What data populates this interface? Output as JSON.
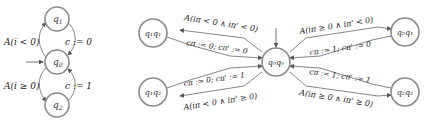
{
  "left_automaton": {
    "states": [
      {
        "id": "q1",
        "label": "q",
        "sub": "1"
      },
      {
        "id": "q0",
        "label": "q",
        "sub": "0"
      },
      {
        "id": "q2",
        "label": "q",
        "sub": "2"
      }
    ],
    "initial": "q0",
    "edges": [
      {
        "from": "q0",
        "to": "q1",
        "label": "A(i < 0)"
      },
      {
        "from": "q1",
        "to": "q0",
        "label": "c := 0"
      },
      {
        "from": "q0",
        "to": "q2",
        "label": "A(i ≥ 0)"
      },
      {
        "from": "q2",
        "to": "q0",
        "label": "c := 1"
      }
    ]
  },
  "product_automaton": {
    "states": [
      {
        "id": "q0q0",
        "label": "q₀q₀"
      },
      {
        "id": "q1q1",
        "label": "q₁q₁"
      },
      {
        "id": "q1q2",
        "label": "q₁q₂"
      },
      {
        "id": "q2q1",
        "label": "q₂q₁"
      },
      {
        "id": "q2q2",
        "label": "q₂q₂"
      }
    ],
    "initial": "q0q0",
    "edges": [
      {
        "from": "q0q0",
        "to": "q1q1",
        "label": "A(iπ < 0 ∧ iπ' < 0)"
      },
      {
        "from": "q1q1",
        "to": "q0q0",
        "label": "cπ := 0; cπ' := 0"
      },
      {
        "from": "q1q2",
        "to": "q0q0",
        "label": "cπ := 0; cπ' := 1"
      },
      {
        "from": "q0q0",
        "to": "q1q2",
        "label": "A(iπ < 0 ∧ iπ' ≥ 0)"
      },
      {
        "from": "q0q0",
        "to": "q2q1",
        "label": "A(iπ ≥ 0 ∧ iπ' < 0)"
      },
      {
        "from": "q2q1",
        "to": "q0q0",
        "label": "cπ := 1; cπ' := 0"
      },
      {
        "from": "q2q2",
        "to": "q0q0",
        "label": "cπ := 1; cπ' := 1"
      },
      {
        "from": "q0q0",
        "to": "q2q2",
        "label": "A(iπ ≥ 0 ∧ iπ' ≥ 0)"
      }
    ]
  },
  "colors": {
    "node_stroke": "#8a8a8a",
    "edge": "#555555",
    "text": "#222222"
  }
}
